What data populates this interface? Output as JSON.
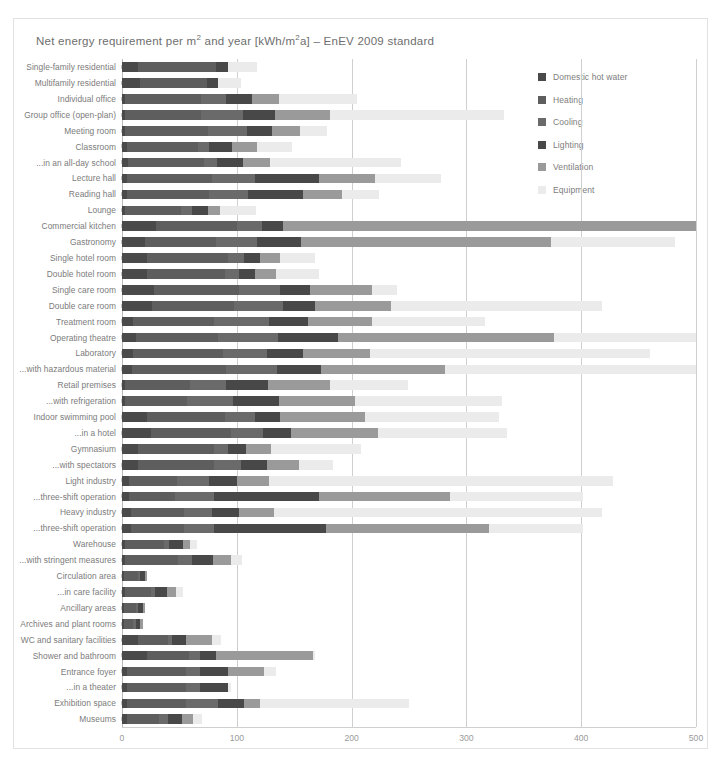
{
  "chart": {
    "title_prefix": "Net energy requirement per m",
    "title_sup1": "2",
    "title_mid": " and year [kWh/m",
    "title_sup2": "2",
    "title_suffix": "a] – EnEV 2009 standard",
    "title_full": "Net energy requirement per m² and year [kWh/m²a] – EnEV 2009 standard"
  },
  "chart_data": {
    "type": "bar",
    "orientation": "horizontal",
    "stacked": true,
    "xlabel": "",
    "ylabel": "",
    "xlim": [
      0,
      500
    ],
    "xticks": [
      0,
      100,
      200,
      300,
      400,
      500
    ],
    "xtick_labels": [
      "0",
      "100",
      "200",
      "300",
      "400",
      "500"
    ],
    "grid": "vertical",
    "legend_position": "top-right",
    "colors": {
      "Domestic hot water": "#4a4a4a",
      "Heating": "#5e5e5e",
      "Cooling": "#6a6a6a",
      "Lighting": "#484848",
      "Ventilation": "#9a9a9a",
      "Equipment": "#ebebeb"
    },
    "legend": [
      {
        "label": "Domestic hot water",
        "color": "#4a4a4a"
      },
      {
        "label": "Heating",
        "color": "#5e5e5e"
      },
      {
        "label": "Cooling",
        "color": "#6a6a6a"
      },
      {
        "label": "Lighting",
        "color": "#484848"
      },
      {
        "label": "Ventilation",
        "color": "#9a9a9a"
      },
      {
        "label": "Equipment",
        "color": "#ebebeb"
      }
    ],
    "categories": [
      "Single-family residential",
      "Multifamily residential",
      "Individual office",
      "Group office (open-plan)",
      "Meeting room",
      "Classroom",
      "...in an all-day school",
      "Lecture hall",
      "Reading hall",
      "Lounge",
      "Commercial kitchen",
      "Gastronomy",
      "Single hotel room",
      "Double hotel room",
      "Single care room",
      "Double care room",
      "Treatment room",
      "Operating theatre",
      "Laboratory",
      "...with hazardous material",
      "Retail premises",
      "...with refrigeration",
      "Indoor swimming pool",
      "...in a hotel",
      "Gymnasium",
      "...with spectators",
      "Light industry",
      "...three-shift operation",
      "Heavy industry",
      "...three-shift operation",
      "Warehouse",
      "...with stringent measures",
      "Circulation area",
      "...in care facility",
      "Ancillary areas",
      "Archives and plant rooms",
      "WC and sanitary facilities",
      "Shower and bathroom",
      "Entrance foyer",
      "...in a theater",
      "Exhibition space",
      "Museums"
    ],
    "series": [
      {
        "name": "Domestic hot water",
        "values": [
          14,
          16,
          3,
          3,
          3,
          4,
          5,
          4,
          4,
          3,
          30,
          20,
          22,
          22,
          28,
          26,
          10,
          12,
          10,
          9,
          3,
          3,
          22,
          25,
          14,
          14,
          6,
          6,
          8,
          8,
          3,
          3,
          2,
          3,
          2,
          2,
          14,
          22,
          4,
          4,
          4,
          4
        ]
      },
      {
        "name": "Heating",
        "values": [
          68,
          58,
          66,
          66,
          72,
          62,
          66,
          74,
          72,
          48,
          70,
          62,
          70,
          68,
          74,
          72,
          70,
          72,
          78,
          82,
          56,
          54,
          68,
          70,
          66,
          66,
          42,
          40,
          46,
          46,
          34,
          46,
          12,
          22,
          10,
          8,
          26,
          36,
          52,
          52,
          52,
          28
        ]
      },
      {
        "name": "Cooling",
        "values": [
          0,
          0,
          22,
          36,
          34,
          10,
          12,
          38,
          34,
          10,
          22,
          36,
          14,
          12,
          36,
          42,
          48,
          52,
          38,
          44,
          32,
          40,
          26,
          28,
          12,
          24,
          28,
          34,
          24,
          26,
          4,
          12,
          2,
          4,
          2,
          2,
          4,
          10,
          12,
          12,
          28,
          8
        ]
      },
      {
        "name": "Lighting",
        "values": [
          10,
          10,
          22,
          28,
          22,
          20,
          22,
          56,
          48,
          14,
          18,
          38,
          14,
          14,
          26,
          28,
          34,
          52,
          32,
          38,
          36,
          40,
          22,
          24,
          16,
          22,
          24,
          92,
          24,
          98,
          12,
          18,
          4,
          10,
          4,
          4,
          12,
          14,
          24,
          24,
          22,
          12
        ]
      },
      {
        "name": "Ventilation",
        "values": [
          0,
          0,
          24,
          48,
          24,
          22,
          24,
          48,
          34,
          10,
          360,
          218,
          18,
          18,
          54,
          66,
          56,
          188,
          58,
          108,
          54,
          66,
          74,
          76,
          22,
          28,
          28,
          114,
          30,
          142,
          6,
          16,
          2,
          8,
          2,
          2,
          22,
          84,
          32,
          0,
          14,
          10
        ]
      },
      {
        "name": "Equipment",
        "values": [
          26,
          20,
          68,
          152,
          24,
          30,
          114,
          58,
          32,
          32,
          0,
          108,
          30,
          38,
          22,
          184,
          98,
          124,
          244,
          220,
          68,
          128,
          116,
          112,
          78,
          30,
          300,
          116,
          286,
          82,
          6,
          10,
          0,
          6,
          0,
          0,
          8,
          2,
          10,
          3,
          130,
          8
        ]
      }
    ],
    "totals": [
      118,
      104,
      205,
      333,
      179,
      148,
      243,
      278,
      224,
      117,
      500,
      482,
      168,
      172,
      240,
      418,
      316,
      500,
      460,
      500,
      249,
      331,
      328,
      335,
      208,
      184,
      428,
      402,
      418,
      402,
      65,
      105,
      22,
      53,
      20,
      18,
      86,
      168,
      134,
      95,
      250,
      70
    ]
  }
}
